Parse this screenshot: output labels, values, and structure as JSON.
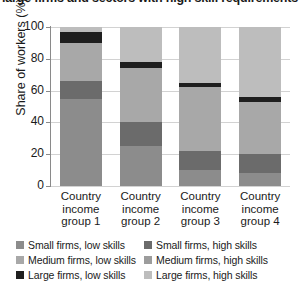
{
  "chart_data": {
    "type": "bar",
    "subtype": "stacked-vertical-100pct",
    "title": "large firms and sectors with high skill requirements",
    "xlabel": "",
    "ylabel": "Share of workers (%)",
    "ylim": [
      0,
      100
    ],
    "yticks": [
      0,
      20,
      40,
      60,
      80,
      100
    ],
    "grid": true,
    "legend_position": "bottom",
    "categories": [
      "Country income group 1",
      "Country income group 2",
      "Country income group 3",
      "Country income group 4"
    ],
    "category_lines": [
      [
        "Country",
        "income",
        "group 1"
      ],
      [
        "Country",
        "income",
        "group 2"
      ],
      [
        "Country",
        "income",
        "group 3"
      ],
      [
        "Country",
        "income",
        "group 4"
      ]
    ],
    "series": [
      {
        "name": "Small firms, low skills",
        "key": "small_low",
        "color": "#8c8c8c",
        "values": [
          55,
          25,
          10,
          8
        ]
      },
      {
        "name": "Small firms, high skills",
        "key": "small_high",
        "color": "#6b6b6b",
        "values": [
          11,
          15,
          12,
          12
        ]
      },
      {
        "name": "Medium firms, low skills",
        "key": "medium_low",
        "color": "#a8a8a8",
        "values": [
          24,
          34,
          40,
          33
        ]
      },
      {
        "name": "Medium firms, high skills",
        "key": "medium_high",
        "color": "#9c9c9c",
        "values": [
          0,
          0,
          0,
          0
        ]
      },
      {
        "name": "Large firms, low skills",
        "key": "large_low",
        "color": "#1f1f1f",
        "values": [
          7,
          4,
          3,
          3
        ]
      },
      {
        "name": "Large firms, high skills",
        "key": "large_high",
        "color": "#bdbdbd",
        "values": [
          3,
          22,
          35,
          44
        ]
      }
    ],
    "legend_entries": [
      {
        "label": "Small firms, low skills",
        "color": "#8c8c8c"
      },
      {
        "label": "Small firms, high skills",
        "color": "#6b6b6b"
      },
      {
        "label": "Medium firms, low skills",
        "color": "#a8a8a8"
      },
      {
        "label": "Medium firms, high skills",
        "color": "#9c9c9c"
      },
      {
        "label": "Large firms, low skills",
        "color": "#1f1f1f"
      },
      {
        "label": "Large firms, high skills",
        "color": "#bdbdbd"
      }
    ],
    "stack_order_bottom_to_top": [
      "small_low",
      "small_high",
      "medium_low",
      "large_low",
      "large_high"
    ]
  },
  "colors": {
    "axis": "#8a8a8a",
    "grid": "#d2d2d2",
    "text": "#1a1a1a",
    "background": "#ffffff"
  }
}
